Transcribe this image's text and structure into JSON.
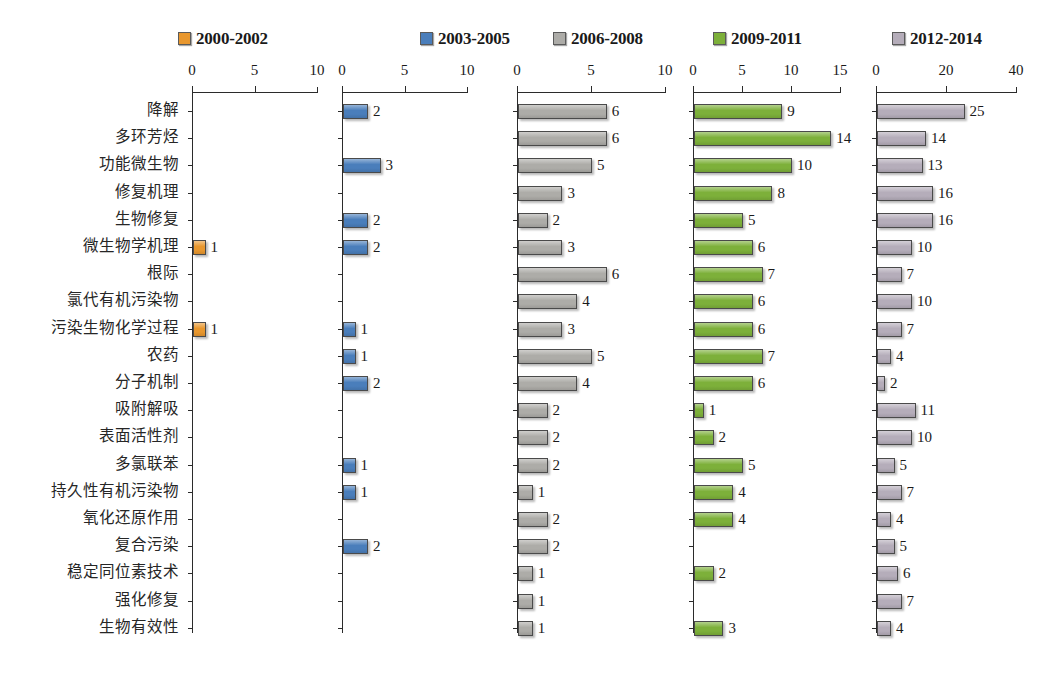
{
  "chart_data": {
    "type": "bar",
    "title": "",
    "subtitle": "",
    "xlabel": "",
    "ylabel": "",
    "grid": false,
    "legend_position": "top",
    "orientation": "horizontal",
    "layout": "small-multiples-5-panels",
    "categories": [
      "降解",
      "多环芳烃",
      "功能微生物",
      "修复机理",
      "生物修复",
      "微生物学机理",
      "根际",
      "氯代有机污染物",
      "污染生物化学过程",
      "农药",
      "分子机制",
      "吸附解吸",
      "表面活性剂",
      "多氯联苯",
      "持久性有机污染物",
      "氧化还原作用",
      "复合污染",
      "稳定同位素技术",
      "强化修复",
      "生物有效性"
    ],
    "series": [
      {
        "name": "2000-2002",
        "color": "#E8972E",
        "xlim": [
          0,
          10
        ],
        "ticks": [
          0,
          5,
          10
        ],
        "tick_labels": [
          "0",
          "5",
          "10"
        ],
        "values": [
          0,
          0,
          0,
          0,
          0,
          1,
          0,
          0,
          1,
          0,
          0,
          0,
          0,
          0,
          0,
          0,
          0,
          0,
          0,
          0
        ]
      },
      {
        "name": "2003-2005",
        "color": "#4A7EBB",
        "xlim": [
          0,
          10
        ],
        "ticks": [
          0,
          5,
          10
        ],
        "tick_labels": [
          "0",
          "5",
          "10"
        ],
        "values": [
          2,
          0,
          3,
          0,
          2,
          2,
          0,
          0,
          1,
          1,
          2,
          0,
          0,
          1,
          1,
          0,
          2,
          0,
          0,
          0
        ]
      },
      {
        "name": "2006-2008",
        "color": "#ADACA8",
        "xlim": [
          0,
          10
        ],
        "ticks": [
          0,
          5,
          10
        ],
        "tick_labels": [
          "0",
          "5",
          "10"
        ],
        "values": [
          6,
          6,
          5,
          3,
          2,
          3,
          6,
          4,
          3,
          5,
          4,
          2,
          2,
          2,
          1,
          2,
          2,
          1,
          1,
          1
        ]
      },
      {
        "name": "2009-2011",
        "color": "#7DB03A",
        "xlim": [
          0,
          15
        ],
        "ticks": [
          0,
          5,
          10,
          15
        ],
        "tick_labels": [
          "0",
          "5",
          "10",
          "15"
        ],
        "values": [
          9,
          14,
          10,
          8,
          5,
          6,
          7,
          6,
          6,
          7,
          6,
          1,
          2,
          5,
          4,
          4,
          0,
          2,
          0,
          3
        ]
      },
      {
        "name": "2012-2014",
        "color": "#B5ADBA",
        "xlim": [
          0,
          40
        ],
        "ticks": [
          0,
          20,
          40
        ],
        "tick_labels": [
          "0",
          "20",
          "40"
        ],
        "values": [
          25,
          14,
          13,
          16,
          16,
          10,
          7,
          10,
          7,
          4,
          2,
          11,
          10,
          5,
          7,
          4,
          5,
          6,
          7,
          4
        ]
      }
    ]
  },
  "legend": {
    "items": [
      {
        "label": "2000-2002",
        "color": "#E8972E"
      },
      {
        "label": "2003-2005",
        "color": "#4A7EBB"
      },
      {
        "label": "2006-2008",
        "color": "#ADACA8"
      },
      {
        "label": "2009-2011",
        "color": "#7DB03A"
      },
      {
        "label": "2012-2014",
        "color": "#B5ADBA"
      }
    ]
  }
}
